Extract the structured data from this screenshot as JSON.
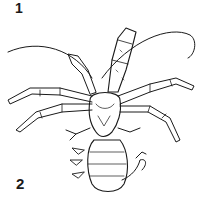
{
  "figure": {
    "labels": [
      "1",
      "2"
    ],
    "colors": {
      "ink": "#1a1a1a",
      "background": "#ffffff"
    }
  }
}
